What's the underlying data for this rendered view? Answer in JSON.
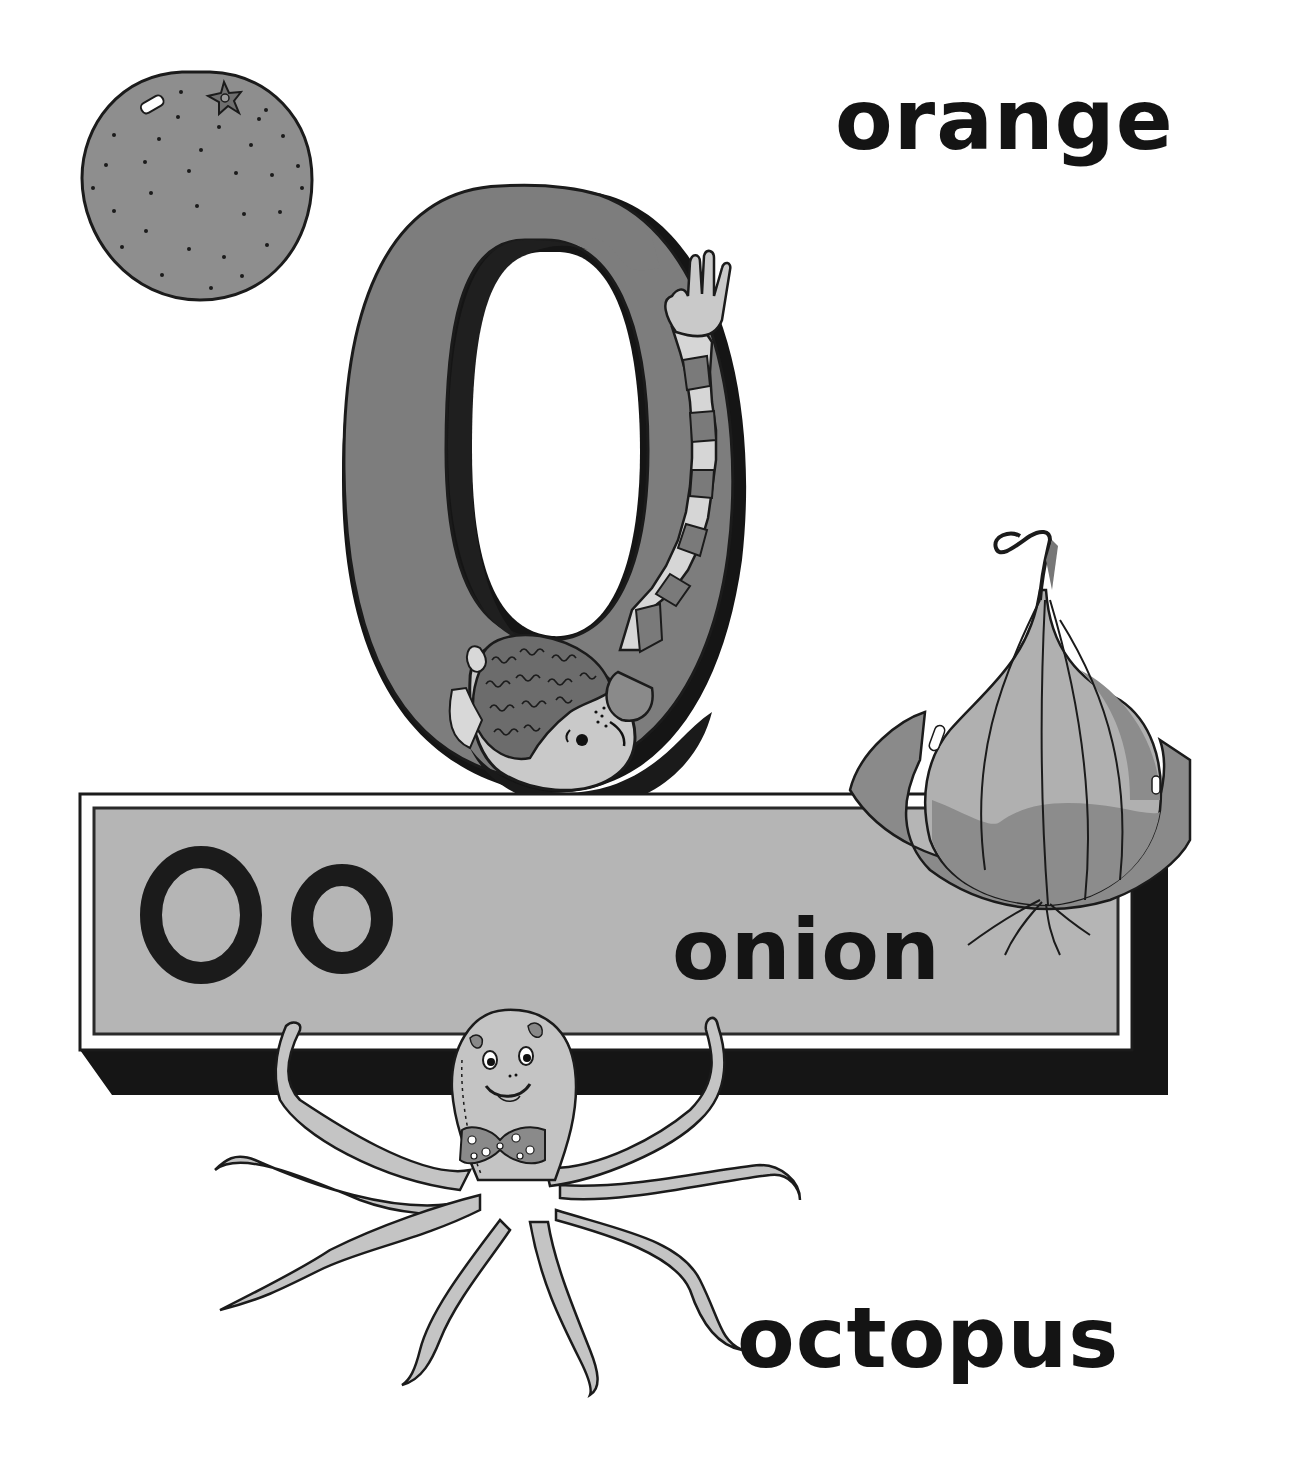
{
  "page": {
    "letter_upper": "O",
    "letter_lower": "o",
    "words": {
      "orange": "orange",
      "onion": "onion",
      "octopus": "octopus"
    }
  },
  "palette": {
    "paper": "#ffffff",
    "ink": "#141414",
    "letter_fill": "#7d7d7d",
    "sign_face": "#b5b5b5",
    "sign_shadow": "#151515",
    "orange_fill": "#8e8e8e",
    "onion_light": "#b0b0b0",
    "onion_mid": "#8c8c8c",
    "octopus_fill": "#c4c4c4",
    "stripe_light": "#d6d6d6",
    "stripe_dark": "#7a7a7a",
    "skin": "#c9c9c9"
  }
}
